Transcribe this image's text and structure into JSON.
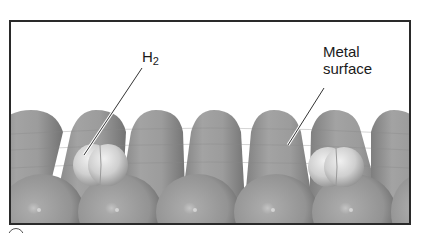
{
  "figure": {
    "type": "diagram",
    "labels": {
      "h2": {
        "main": "H",
        "subscript": "2"
      },
      "metal_surface": {
        "line1": "Metal",
        "line2": "surface"
      }
    },
    "elements": {
      "metal_atoms": "rows of gray spheres forming the metal surface",
      "h2_molecules": 2
    },
    "colors": {
      "frame_border": "#2a2a2a",
      "metal_atom": "#9a9a9a",
      "metal_atom_dark": "#7a7a7a",
      "h2_atom": "#d0d0d0",
      "background": "#ffffff",
      "text": "#1a1a1a"
    }
  }
}
